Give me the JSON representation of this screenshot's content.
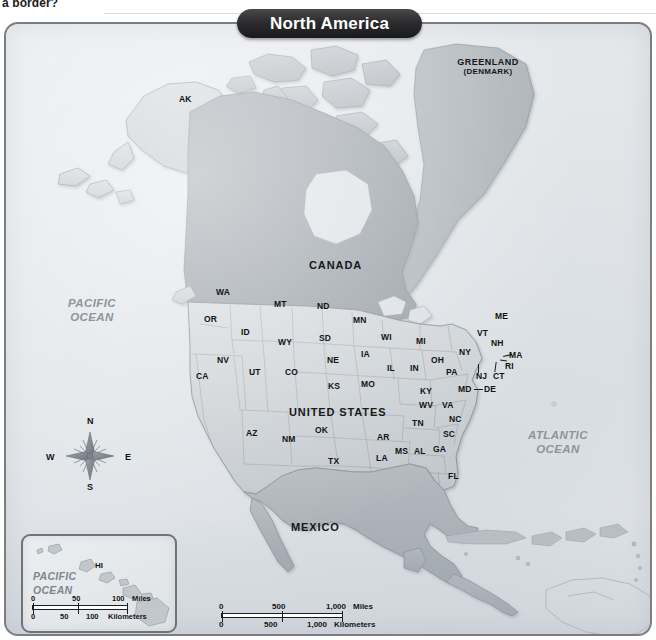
{
  "page": {
    "scrap_text": "a border?"
  },
  "map": {
    "title": "North America",
    "countries": [
      {
        "name": "CANADA"
      },
      {
        "name": "UNITED STATES"
      },
      {
        "name": "MEXICO"
      }
    ],
    "regions": [
      {
        "name": "GREENLAND",
        "sub": "(DENMARK)"
      }
    ],
    "oceans": [
      {
        "name": "PACIFIC",
        "name2": "OCEAN"
      },
      {
        "name": "ATLANTIC",
        "name2": "OCEAN"
      }
    ],
    "states": [
      {
        "code": "AK"
      },
      {
        "code": "WA"
      },
      {
        "code": "OR"
      },
      {
        "code": "ID"
      },
      {
        "code": "MT"
      },
      {
        "code": "ND"
      },
      {
        "code": "MN"
      },
      {
        "code": "SD"
      },
      {
        "code": "WY"
      },
      {
        "code": "NV"
      },
      {
        "code": "CA"
      },
      {
        "code": "UT"
      },
      {
        "code": "CO"
      },
      {
        "code": "NE"
      },
      {
        "code": "IA"
      },
      {
        "code": "WI"
      },
      {
        "code": "MI"
      },
      {
        "code": "IL"
      },
      {
        "code": "IN"
      },
      {
        "code": "OH"
      },
      {
        "code": "KS"
      },
      {
        "code": "MO"
      },
      {
        "code": "KY"
      },
      {
        "code": "WV"
      },
      {
        "code": "VA"
      },
      {
        "code": "PA"
      },
      {
        "code": "NY"
      },
      {
        "code": "VT"
      },
      {
        "code": "NH"
      },
      {
        "code": "ME"
      },
      {
        "code": "MA"
      },
      {
        "code": "RI"
      },
      {
        "code": "CT"
      },
      {
        "code": "NJ"
      },
      {
        "code": "MD"
      },
      {
        "code": "DE"
      },
      {
        "code": "NC"
      },
      {
        "code": "SC"
      },
      {
        "code": "TN"
      },
      {
        "code": "AR"
      },
      {
        "code": "MS"
      },
      {
        "code": "AL"
      },
      {
        "code": "GA"
      },
      {
        "code": "FL"
      },
      {
        "code": "LA"
      },
      {
        "code": "TX"
      },
      {
        "code": "OK"
      },
      {
        "code": "NM"
      },
      {
        "code": "AZ"
      },
      {
        "code": "HI"
      }
    ],
    "compass": {
      "north": "N",
      "east": "E",
      "south": "S",
      "west": "W"
    },
    "inset": {
      "ocean_line1": "PACIFIC",
      "ocean_line2": "OCEAN",
      "state": "HI",
      "scale_miles": {
        "ticks": [
          "0",
          "50",
          "100"
        ],
        "unit": "Miles"
      },
      "scale_km": {
        "ticks": [
          "0",
          "50",
          "100"
        ],
        "unit": "Kilometers"
      }
    },
    "scale": {
      "miles": {
        "ticks": [
          "0",
          "500",
          "1,000"
        ],
        "unit": "Miles"
      },
      "kilometers": {
        "ticks": [
          "0",
          "500",
          "1,000"
        ],
        "unit": "Kilometers"
      }
    },
    "colors": {
      "banner_bg": "#1f1f21",
      "banner_text": "#ffffff",
      "ocean_bg": "#e3e7ea",
      "land_light": "#cfd3d6",
      "land_mid": "#b4babf",
      "land_dark": "#9aa1a7",
      "border": "#7b7e83",
      "label_text": "#16171a",
      "ocean_label": "#8d949b"
    }
  }
}
